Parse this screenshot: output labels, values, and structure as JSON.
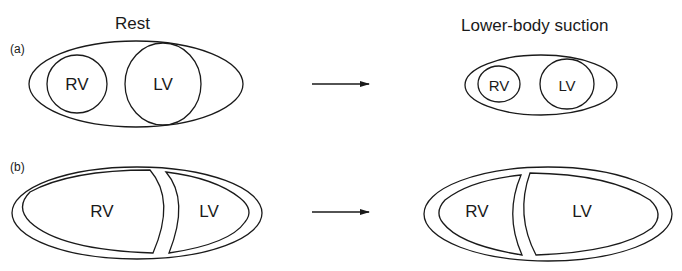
{
  "titles": {
    "left": "Rest",
    "right": "Lower-body suction"
  },
  "panels": [
    {
      "label": "(a)",
      "left": {
        "rv": "RV",
        "lv": "LV"
      },
      "right": {
        "rv": "RV",
        "lv": "LV"
      }
    },
    {
      "label": "(b)",
      "left": {
        "rv": "RV",
        "lv": "LV"
      },
      "right": {
        "rv": "RV",
        "lv": "LV"
      }
    }
  ],
  "colors": {
    "stroke": "#1a1a1a",
    "background": "#ffffff"
  }
}
